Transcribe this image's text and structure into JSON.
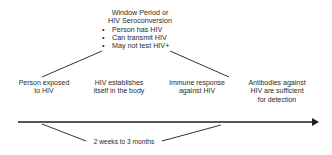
{
  "window_period": {
    "title_line1": "Window Period or",
    "title_line2": "HIV Seroconversion",
    "bullets": [
      "Person has HIV",
      "Can transmit HIV",
      "May not test HIV+"
    ]
  },
  "stages": [
    {
      "line1": "Person exposed",
      "line2": "to HIV",
      "line3": ""
    },
    {
      "line1": "HIV establishes",
      "line2": "itself in the body",
      "line3": ""
    },
    {
      "line1": "Immune response",
      "line2": "against HIV",
      "line3": ""
    },
    {
      "line1": "Antibodies against",
      "line2": "HIV are sufficient",
      "line3": "for detection"
    }
  ],
  "duration_label": "2 weeks to 3 months",
  "colors": {
    "line": "#1f1f1f",
    "text": "#2a2a2a"
  }
}
